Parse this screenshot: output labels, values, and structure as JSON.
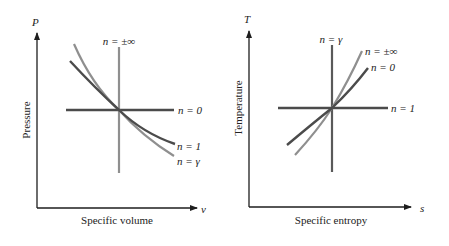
{
  "colors": {
    "axis": "#1e1e1e",
    "dark_curve": "#4b4b4b",
    "light_curve": "#8f8f8f",
    "text": "#222222",
    "background": "#ffffff"
  },
  "left_panel": {
    "title": "P-v diagram of polytropic processes",
    "y_axis_symbol": "P",
    "y_axis_label": "Pressure",
    "x_axis_symbol": "v",
    "x_axis_label": "Specific volume",
    "curves": [
      {
        "label": "n = ±∞",
        "shape": "vertical line",
        "shade": "light"
      },
      {
        "label": "n = 0",
        "shape": "horizontal line",
        "shade": "dark"
      },
      {
        "label": "n = 1",
        "shape": "decreasing curve (less steep)",
        "shade": "dark"
      },
      {
        "label": "n = γ",
        "shape": "decreasing curve (steeper)",
        "shade": "light"
      }
    ]
  },
  "right_panel": {
    "title": "T-s diagram of polytropic processes",
    "y_axis_symbol": "T",
    "y_axis_label": "Temperature",
    "x_axis_symbol": "s",
    "x_axis_label": "Specific entropy",
    "curves": [
      {
        "label": "n = γ",
        "shape": "vertical line",
        "shade": "dark"
      },
      {
        "label": "n = ±∞",
        "shape": "increasing curve (steeper)",
        "shade": "light"
      },
      {
        "label": "n = 0",
        "shape": "increasing curve (less steep)",
        "shade": "dark"
      },
      {
        "label": "n = 1",
        "shape": "horizontal line",
        "shade": "dark"
      }
    ]
  }
}
